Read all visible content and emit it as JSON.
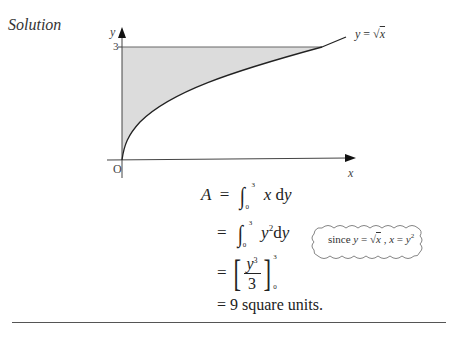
{
  "heading": "Solution",
  "graph": {
    "y_axis_label": "y",
    "x_axis_label": "x",
    "origin_label": "O",
    "y_tick_label": "3",
    "curve_label_lhs": "y",
    "curve_label_eq": "=",
    "curve_label_rhs": "x",
    "curve_label_sqrt": "√",
    "shade_color": "#dcdcdc",
    "axis_color": "#333333"
  },
  "equations": {
    "line1": {
      "lhs": "A",
      "eq": "=",
      "upper": "3",
      "lower": "0",
      "integrand": "x",
      "d": "d",
      "var": "y"
    },
    "line2": {
      "eq": "=",
      "upper": "3",
      "lower": "0",
      "integrand_base": "y",
      "integrand_exp": "2",
      "d": "d",
      "var": "y"
    },
    "line3": {
      "eq": "=",
      "num_base": "y",
      "num_exp": "3",
      "den": "3",
      "upper": "3",
      "lower": "0"
    },
    "line4": {
      "text": "= 9 square units."
    }
  },
  "note": {
    "since": "since",
    "y": "y",
    "eq1": "=",
    "sqrt": "√",
    "x1": "x",
    "comma": ",",
    "x2": "x",
    "eq2": "=",
    "y2": "y",
    "exp": "2"
  }
}
